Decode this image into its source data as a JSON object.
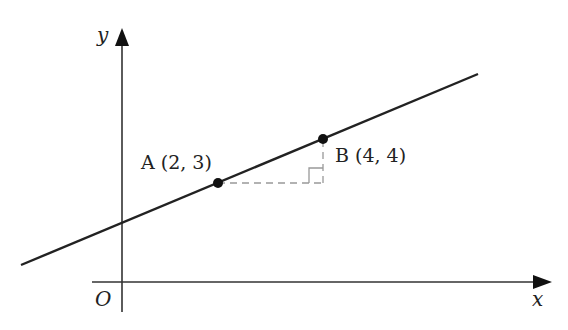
{
  "diagram": {
    "type": "coordinate-plane-line",
    "axes": {
      "x_label": "x",
      "y_label": "y",
      "origin_label": "O"
    },
    "points": [
      {
        "name": "A",
        "label": "A (2, 3)",
        "x": 2,
        "y": 3
      },
      {
        "name": "B",
        "label": "B (4, 4)",
        "x": 4,
        "y": 4
      }
    ],
    "annotations": {
      "run_rise_triangle": "dashed horizontal from A and dashed vertical down from B with right-angle marker"
    },
    "colors": {
      "line": "#222222",
      "axis": "#333333",
      "dashed": "#999999",
      "point": "#111111"
    }
  }
}
